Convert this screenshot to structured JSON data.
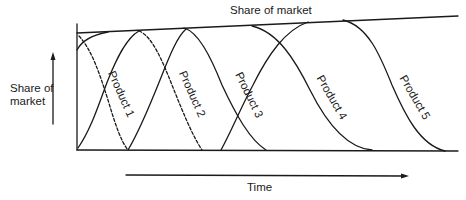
{
  "diagram": {
    "top_label": "Share of market",
    "y_axis_label_line1": "Share of",
    "y_axis_label_line2": "market",
    "x_axis_label": "Time",
    "products": [
      {
        "name": "Product 1",
        "decline_style": "dashed"
      },
      {
        "name": "Product 2",
        "decline_style": "dashed"
      },
      {
        "name": "Product 3",
        "decline_style": "solid"
      },
      {
        "name": "Product 4",
        "decline_style": "solid"
      },
      {
        "name": "Product 5",
        "decline_style": "solid"
      }
    ],
    "colors": {
      "line": "#1a1a1a",
      "background": "#ffffff"
    }
  }
}
